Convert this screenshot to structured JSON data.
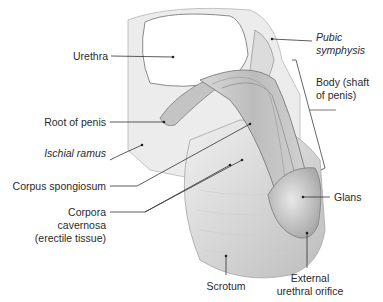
{
  "diagram": {
    "type": "anatomical-illustration",
    "labels": {
      "urethra": "Urethra",
      "pubic_symphysis_1": "Pubic",
      "pubic_symphysis_2": "symphysis",
      "body_1": "Body (shaft",
      "body_2": "of penis)",
      "root": "Root of penis",
      "ischial_ramus": "Ischial ramus",
      "corpus_spongiosum": "Corpus spongiosum",
      "corpora_1": "Corpora",
      "corpora_2": "cavernosa",
      "corpora_3": "(erectile tissue)",
      "glans": "Glans",
      "scrotum": "Scrotum",
      "orifice_1": "External",
      "orifice_2": "urethral orifice"
    },
    "colors": {
      "tissue_light": "#e6e6e6",
      "tissue_mid": "#c9c9c9",
      "tissue_dark": "#9a9a9a",
      "leader_line": "#333333"
    }
  }
}
